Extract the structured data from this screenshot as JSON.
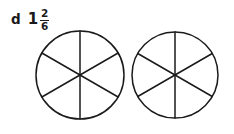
{
  "page": {
    "width": 234,
    "height": 134,
    "background_color": "#ffffff",
    "ink_color": "#1a1a1a"
  },
  "label": {
    "item_letter": "d",
    "whole_number": "1",
    "numerator": "2",
    "denominator": "6",
    "full_text": "d 1 2/6"
  },
  "chart_data": {
    "type": "pie",
    "title": "",
    "xlabel": "",
    "ylabel": "",
    "shaded_count": 0,
    "total_parts": 12,
    "grid": false,
    "legend": false,
    "shapes": [
      {
        "name": "circle-1",
        "cx": 80,
        "cy": 75,
        "r": 44,
        "slices": 6,
        "slice_value": 1,
        "categories": [
          "1/6",
          "1/6",
          "1/6",
          "1/6",
          "1/6",
          "1/6"
        ],
        "values": [
          1,
          1,
          1,
          1,
          1,
          1
        ],
        "shaded": [
          false,
          false,
          false,
          false,
          false,
          false
        ],
        "fill": "#ffffff",
        "stroke": "#1a1a1a",
        "stroke_width": 1.5,
        "divider_angles_deg": [
          90,
          30,
          150
        ]
      },
      {
        "name": "circle-2",
        "cx": 175,
        "cy": 75,
        "r": 43,
        "slices": 6,
        "slice_value": 1,
        "categories": [
          "1/6",
          "1/6",
          "1/6",
          "1/6",
          "1/6",
          "1/6"
        ],
        "values": [
          1,
          1,
          1,
          1,
          1,
          1
        ],
        "shaded": [
          false,
          false,
          false,
          false,
          false,
          false
        ],
        "fill": "#ffffff",
        "stroke": "#1a1a1a",
        "stroke_width": 1.5,
        "divider_angles_deg": [
          90,
          30,
          150
        ]
      }
    ]
  }
}
